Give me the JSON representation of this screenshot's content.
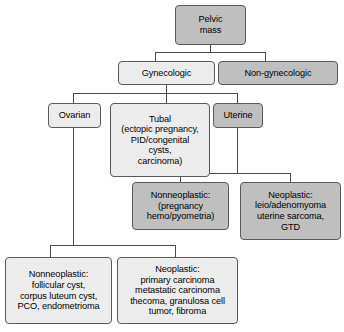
{
  "diagram": {
    "type": "tree-flowchart",
    "colors": {
      "box_fill_light": "#ececed",
      "box_fill_dark": "#bfbfc0",
      "box_border": "#5a5a5a",
      "connector": "#4a4a4a",
      "background": "#ffffff",
      "text": "#000000"
    },
    "nodes": {
      "root": {
        "label": "Pelvic\nmass",
        "shade": "dark"
      },
      "gynecologic": {
        "label": "Gynecologic",
        "shade": "light"
      },
      "non_gynecologic": {
        "label": "Non-gynecologic",
        "shade": "dark"
      },
      "ovarian": {
        "label": "Ovarian",
        "shade": "light"
      },
      "tubal": {
        "label": "Tubal\n(ectopic pregnancy,\nPID/congenital\ncysts,\ncarcinoma)",
        "shade": "light"
      },
      "uterine": {
        "label": "Uterine",
        "shade": "dark"
      },
      "uterine_nonneoplastic": {
        "label": "Nonneoplastic:\n(pregnancy\nhemo/pyometria)",
        "shade": "dark"
      },
      "uterine_neoplastic": {
        "label": "Neoplastic:\nleio/adenomyoma\nuterine sarcoma,\nGTD",
        "shade": "dark"
      },
      "ovarian_nonneoplastic": {
        "label": "Nonneoplastic:\nfollicular cyst,\ncorpus luteum cyst,\nPCO, endometrioma",
        "shade": "light"
      },
      "ovarian_neoplastic": {
        "label": "Neoplastic:\nprimary carcinoma\nmetastatic carcinoma\nthecoma, granulosa cell\ntumor, fibroma",
        "shade": "light"
      }
    },
    "edges": [
      {
        "from": "root",
        "to": "gynecologic"
      },
      {
        "from": "root",
        "to": "non_gynecologic"
      },
      {
        "from": "gynecologic",
        "to": "ovarian"
      },
      {
        "from": "gynecologic",
        "to": "tubal"
      },
      {
        "from": "gynecologic",
        "to": "uterine"
      },
      {
        "from": "uterine",
        "to": "uterine_nonneoplastic"
      },
      {
        "from": "uterine",
        "to": "uterine_neoplastic"
      },
      {
        "from": "ovarian",
        "to": "ovarian_nonneoplastic"
      },
      {
        "from": "ovarian",
        "to": "ovarian_neoplastic"
      }
    ]
  }
}
